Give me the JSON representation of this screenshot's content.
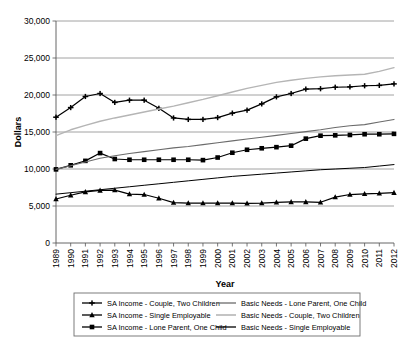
{
  "chart_data": {
    "type": "line",
    "title": "",
    "xlabel": "Year",
    "ylabel": "Dollars",
    "grid": true,
    "legend_position": "bottom",
    "ylim": [
      0,
      30000
    ],
    "ytick_labels": [
      "0",
      "5,000",
      "10,000",
      "15,000",
      "20,000",
      "25,000",
      "30,000"
    ],
    "ytick_values": [
      0,
      5000,
      10000,
      15000,
      20000,
      25000,
      30000
    ],
    "categories": [
      "1989",
      "1990",
      "1991",
      "1992",
      "1993",
      "1994",
      "1995",
      "1996",
      "1997",
      "1998",
      "1999",
      "2000",
      "2001",
      "2002",
      "2003",
      "2004",
      "2005",
      "2006",
      "2007",
      "2008",
      "2009",
      "2010",
      "2011",
      "2012"
    ],
    "series": [
      {
        "name": "SA Income - Couple, Two Children",
        "marker": "plus",
        "color": "#000000",
        "width": 1.2,
        "values": [
          17000,
          18300,
          19800,
          20200,
          19000,
          19300,
          19300,
          18200,
          16900,
          16700,
          16700,
          16950,
          17550,
          17950,
          18800,
          19750,
          20200,
          20800,
          20850,
          21050,
          21100,
          21250,
          21300,
          21500
        ]
      },
      {
        "name": "SA Income - Single Employable",
        "marker": "triangle",
        "color": "#000000",
        "width": 1.2,
        "values": [
          5950,
          6450,
          6900,
          7100,
          7150,
          6600,
          6550,
          6050,
          5450,
          5400,
          5400,
          5400,
          5400,
          5350,
          5400,
          5500,
          5550,
          5550,
          5500,
          6200,
          6550,
          6650,
          6700,
          6800
        ]
      },
      {
        "name": "SA Income - Lone Parent, One Child",
        "marker": "square",
        "color": "#000000",
        "width": 1.2,
        "values": [
          9950,
          10500,
          11100,
          12150,
          11350,
          11250,
          11250,
          11250,
          11250,
          11250,
          11200,
          11550,
          12200,
          12600,
          12800,
          12950,
          13150,
          14100,
          14500,
          14550,
          14600,
          14700,
          14700,
          14750
        ]
      },
      {
        "name": "Basic Needs - Lone Parent, One Child",
        "marker": "none",
        "color": "#6b6b6b",
        "width": 1.1,
        "values": [
          9950,
          10450,
          10950,
          11450,
          11800,
          12100,
          12350,
          12600,
          12850,
          13050,
          13300,
          13550,
          13800,
          14050,
          14300,
          14550,
          14800,
          15050,
          15300,
          15600,
          15850,
          16000,
          16350,
          16700
        ]
      },
      {
        "name": "Basic Needs - Couple, Two Children",
        "marker": "none",
        "color": "#b5b5b5",
        "width": 1.4,
        "values": [
          14500,
          15300,
          15900,
          16450,
          16900,
          17300,
          17700,
          18100,
          18500,
          18950,
          19400,
          19900,
          20400,
          20900,
          21300,
          21700,
          22000,
          22250,
          22450,
          22600,
          22700,
          22800,
          23200,
          23700
        ]
      },
      {
        "name": "Basic Needs - Single Employable",
        "marker": "none",
        "color": "#000000",
        "width": 1.0,
        "values": [
          6600,
          6800,
          7000,
          7200,
          7400,
          7600,
          7800,
          8000,
          8200,
          8400,
          8600,
          8800,
          9000,
          9150,
          9300,
          9450,
          9600,
          9750,
          9900,
          10000,
          10100,
          10200,
          10400,
          10600
        ]
      }
    ],
    "legend": [
      {
        "label": "SA Income - Couple, Two Children",
        "marker": "plus",
        "color": "#000000",
        "column": 0
      },
      {
        "label": "SA Income - Single Employable",
        "marker": "triangle",
        "color": "#000000",
        "column": 0
      },
      {
        "label": "SA Income - Lone Parent, One Child",
        "marker": "square",
        "color": "#000000",
        "column": 0
      },
      {
        "label": "Basic Needs - Lone Parent, One Child",
        "marker": "none",
        "color": "#6b6b6b",
        "column": 1
      },
      {
        "label": "Basic Needs - Couple, Two Children",
        "marker": "none",
        "color": "#b5b5b5",
        "column": 1
      },
      {
        "label": "Basic Needs - Single Employable",
        "marker": "none",
        "color": "#000000",
        "column": 1
      }
    ]
  }
}
